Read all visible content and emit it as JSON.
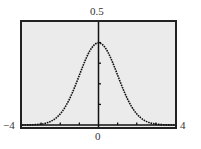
{
  "chart_data": {
    "type": "line",
    "title": "",
    "xlabel": "",
    "ylabel": "",
    "xlim": [
      -4,
      4
    ],
    "ylim": [
      0,
      0.5
    ],
    "x_tick_labels": [
      "-4",
      "0",
      "4"
    ],
    "y_tick_labels": [
      "0.5"
    ],
    "x_ticks_minor": [
      -3,
      -2,
      -1,
      1,
      2,
      3
    ],
    "y_ticks_minor": [
      0.1,
      0.2,
      0.3,
      0.4
    ],
    "grid": false,
    "legend": null,
    "series": [
      {
        "name": "standard normal density",
        "style": "dotted",
        "x": [
          -4,
          -3.5,
          -3,
          -2.5,
          -2,
          -1.5,
          -1,
          -0.5,
          0,
          0.5,
          1,
          1.5,
          2,
          2.5,
          3,
          3.5,
          4
        ],
        "values": [
          0.0001,
          0.0009,
          0.0044,
          0.0175,
          0.054,
          0.1295,
          0.242,
          0.3521,
          0.3989,
          0.3521,
          0.242,
          0.1295,
          0.054,
          0.0175,
          0.0044,
          0.0009,
          0.0001
        ]
      }
    ],
    "colors": {
      "background": "#ebebeb",
      "frame": "#222222",
      "curve": "#111111",
      "axis": "#111111"
    }
  },
  "labels": {
    "y_top": "0.5",
    "x_left": "−4",
    "x_right": "4",
    "x_center": "0"
  }
}
